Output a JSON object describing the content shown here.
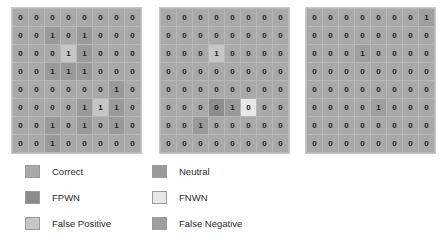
{
  "colors": {
    "correct": "#a9a9a9",
    "neutral": "#9a9a9a",
    "fpwn": "#8c8c8c",
    "fnwn": "#e8e8e8",
    "false_positive": "#c6c6c6",
    "false_negative": "#9f9f9f",
    "background": "#ffffff",
    "grid_border": "#b8b8b8",
    "text": "#1d1d1d"
  },
  "chart_data": {
    "type": "heatmap",
    "title": "",
    "xlabel": "",
    "ylabel": "",
    "rows": 8,
    "cols": 8,
    "legend_position": "bottom",
    "grid": true,
    "panels": [
      {
        "name": "panel-1",
        "values": [
          [
            0,
            0,
            0,
            0,
            0,
            0,
            0,
            0
          ],
          [
            0,
            0,
            1,
            0,
            1,
            0,
            0,
            0
          ],
          [
            0,
            0,
            0,
            1,
            1,
            0,
            0,
            0
          ],
          [
            0,
            0,
            1,
            1,
            1,
            0,
            0,
            0
          ],
          [
            0,
            0,
            0,
            0,
            0,
            0,
            1,
            0
          ],
          [
            0,
            0,
            0,
            0,
            1,
            1,
            1,
            0
          ],
          [
            0,
            0,
            1,
            0,
            1,
            0,
            1,
            0
          ],
          [
            0,
            0,
            1,
            0,
            0,
            0,
            0,
            0
          ]
        ],
        "cell_classes": [
          [
            "correct",
            "correct",
            "correct",
            "correct",
            "correct",
            "correct",
            "correct",
            "correct"
          ],
          [
            "correct",
            "correct",
            "neutral",
            "correct",
            "neutral",
            "correct",
            "correct",
            "correct"
          ],
          [
            "correct",
            "correct",
            "correct",
            "false_positive",
            "neutral",
            "correct",
            "correct",
            "correct"
          ],
          [
            "correct",
            "correct",
            "neutral",
            "neutral",
            "neutral",
            "correct",
            "correct",
            "correct"
          ],
          [
            "correct",
            "correct",
            "correct",
            "correct",
            "correct",
            "correct",
            "neutral",
            "correct"
          ],
          [
            "correct",
            "correct",
            "correct",
            "correct",
            "neutral",
            "false_positive",
            "neutral",
            "correct"
          ],
          [
            "correct",
            "correct",
            "neutral",
            "correct",
            "neutral",
            "correct",
            "neutral",
            "correct"
          ],
          [
            "correct",
            "correct",
            "neutral",
            "correct",
            "correct",
            "correct",
            "correct",
            "correct"
          ]
        ]
      },
      {
        "name": "panel-2",
        "values": [
          [
            0,
            0,
            0,
            0,
            0,
            0,
            0,
            0
          ],
          [
            0,
            0,
            0,
            0,
            0,
            0,
            0,
            0
          ],
          [
            0,
            0,
            0,
            1,
            0,
            0,
            0,
            0
          ],
          [
            0,
            0,
            0,
            0,
            0,
            0,
            0,
            0
          ],
          [
            0,
            0,
            0,
            0,
            0,
            0,
            0,
            0
          ],
          [
            0,
            0,
            0,
            0,
            1,
            0,
            0,
            0
          ],
          [
            0,
            0,
            1,
            0,
            0,
            0,
            0,
            0
          ],
          [
            0,
            0,
            0,
            0,
            0,
            0,
            0,
            0
          ]
        ],
        "cell_classes": [
          [
            "correct",
            "correct",
            "correct",
            "correct",
            "correct",
            "correct",
            "correct",
            "correct"
          ],
          [
            "correct",
            "correct",
            "correct",
            "correct",
            "correct",
            "correct",
            "correct",
            "correct"
          ],
          [
            "correct",
            "correct",
            "correct",
            "false_positive",
            "correct",
            "correct",
            "correct",
            "correct"
          ],
          [
            "correct",
            "correct",
            "correct",
            "correct",
            "correct",
            "correct",
            "correct",
            "correct"
          ],
          [
            "correct",
            "correct",
            "correct",
            "correct",
            "correct",
            "correct",
            "correct",
            "correct"
          ],
          [
            "correct",
            "correct",
            "correct",
            "fpwn",
            "neutral",
            "fnwn",
            "correct",
            "correct"
          ],
          [
            "correct",
            "correct",
            "neutral",
            "correct",
            "correct",
            "correct",
            "correct",
            "correct"
          ],
          [
            "correct",
            "correct",
            "correct",
            "correct",
            "correct",
            "correct",
            "correct",
            "correct"
          ]
        ]
      },
      {
        "name": "panel-3",
        "values": [
          [
            0,
            0,
            0,
            0,
            0,
            0,
            0,
            1
          ],
          [
            0,
            0,
            0,
            0,
            0,
            0,
            0,
            0
          ],
          [
            0,
            0,
            0,
            1,
            0,
            0,
            0,
            0
          ],
          [
            0,
            0,
            0,
            0,
            0,
            0,
            0,
            0
          ],
          [
            0,
            0,
            0,
            0,
            0,
            0,
            0,
            0
          ],
          [
            0,
            0,
            0,
            0,
            1,
            0,
            0,
            0
          ],
          [
            0,
            0,
            0,
            0,
            0,
            0,
            0,
            0
          ],
          [
            0,
            0,
            0,
            0,
            0,
            0,
            0,
            0
          ]
        ],
        "cell_classes": [
          [
            "correct",
            "correct",
            "correct",
            "correct",
            "correct",
            "correct",
            "correct",
            "false_negative"
          ],
          [
            "correct",
            "correct",
            "correct",
            "correct",
            "correct",
            "correct",
            "correct",
            "correct"
          ],
          [
            "correct",
            "correct",
            "correct",
            "false_negative",
            "correct",
            "correct",
            "correct",
            "correct"
          ],
          [
            "correct",
            "correct",
            "correct",
            "correct",
            "correct",
            "correct",
            "correct",
            "correct"
          ],
          [
            "correct",
            "correct",
            "correct",
            "correct",
            "correct",
            "correct",
            "correct",
            "correct"
          ],
          [
            "correct",
            "correct",
            "correct",
            "correct",
            "false_negative",
            "correct",
            "correct",
            "correct"
          ],
          [
            "correct",
            "correct",
            "correct",
            "correct",
            "correct",
            "correct",
            "correct",
            "correct"
          ],
          [
            "correct",
            "correct",
            "correct",
            "correct",
            "correct",
            "correct",
            "correct",
            "correct"
          ]
        ]
      }
    ],
    "legend": [
      {
        "label": "Correct",
        "key": "correct",
        "column": "left"
      },
      {
        "label": "FPWN",
        "key": "fpwn",
        "column": "left"
      },
      {
        "label": "False Positive",
        "key": "false_positive",
        "column": "left"
      },
      {
        "label": "Neutral",
        "key": "neutral",
        "column": "right"
      },
      {
        "label": "FNWN",
        "key": "fnwn",
        "column": "right"
      },
      {
        "label": "False Negative",
        "key": "false_negative",
        "column": "right"
      }
    ]
  }
}
